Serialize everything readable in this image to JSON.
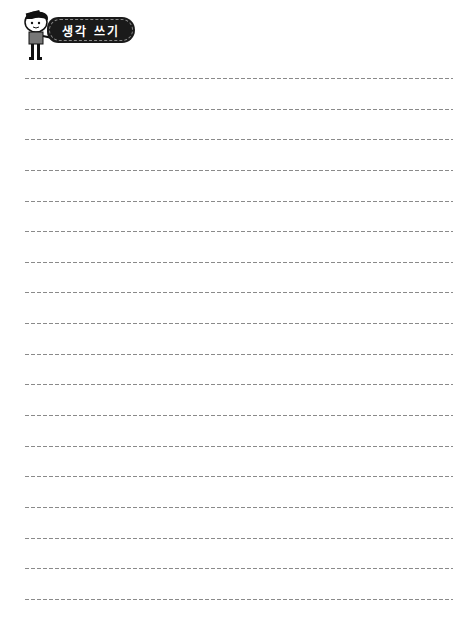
{
  "header": {
    "title": "생각 쓰기",
    "icon": "boy-character-icon"
  },
  "writing_area": {
    "line_count": 18,
    "line_style": "dashed",
    "line_color": "#8a8a8a",
    "lines": [
      "",
      "",
      "",
      "",
      "",
      "",
      "",
      "",
      "",
      "",
      "",
      "",
      "",
      "",
      "",
      "",
      "",
      ""
    ]
  }
}
